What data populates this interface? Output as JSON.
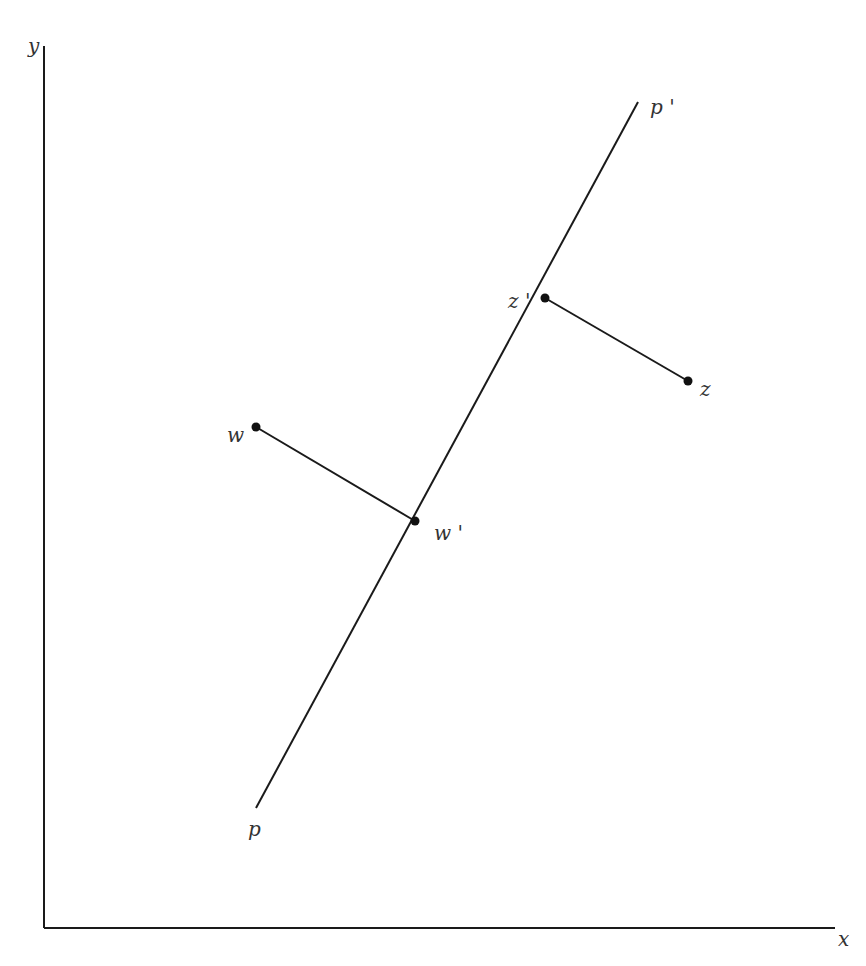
{
  "diagram": {
    "type": "geometric projection",
    "axes": {
      "x_label": "x",
      "y_label": "y"
    },
    "line": {
      "start_label": "p",
      "end_label": "p '"
    },
    "points": [
      {
        "id": "w",
        "label": "w",
        "projection_label": "w '"
      },
      {
        "id": "z",
        "label": "z",
        "projection_label": "z '"
      }
    ],
    "colors": {
      "stroke": "#1a1a1a",
      "text": "#333333",
      "background": "#ffffff"
    }
  }
}
